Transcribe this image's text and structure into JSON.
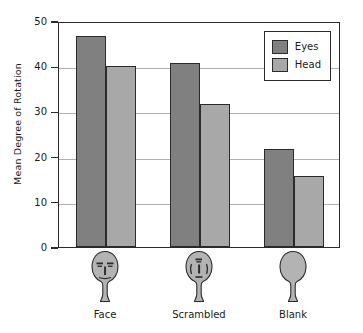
{
  "chart_data": {
    "type": "bar",
    "title": "",
    "subtitle": "",
    "xlabel": "",
    "ylabel": "Mean Degree of Rotation",
    "categories": [
      "Face",
      "Scrambled",
      "Blank"
    ],
    "series": [
      {
        "name": "Eyes",
        "values": [
          46.7,
          40.7,
          21.7
        ],
        "color": "#808080"
      },
      {
        "name": "Head",
        "values": [
          40.0,
          31.7,
          15.8
        ],
        "color": "#a8a8a8"
      }
    ],
    "ylim": [
      0,
      50
    ],
    "yticks": [
      0,
      10,
      20,
      30,
      40,
      50
    ],
    "ytick_labels": [
      "0",
      "10",
      "20",
      "30",
      "40",
      "50"
    ],
    "grid": true,
    "grid_axis": "y",
    "legend_position": "upper right",
    "legend_boxed": true,
    "bar_edge_color": "#2b2b2b",
    "axis_color": "#2b2b2b",
    "gridline_color": "#b0b0b0",
    "background": "#ffffff"
  },
  "legend": {
    "entries": [
      {
        "label": "Eyes",
        "color": "#808080"
      },
      {
        "label": "Head",
        "color": "#a8a8a8"
      }
    ]
  },
  "xaxis": {
    "categories": [
      {
        "label": "Face",
        "icon": "face-pictogram"
      },
      {
        "label": "Scrambled",
        "icon": "scrambled-face-pictogram"
      },
      {
        "label": "Blank",
        "icon": "blank-head-pictogram"
      }
    ]
  },
  "yaxis": {
    "title": "Mean Degree of Rotation",
    "ticks": [
      "0",
      "10",
      "20",
      "30",
      "40",
      "50"
    ]
  }
}
